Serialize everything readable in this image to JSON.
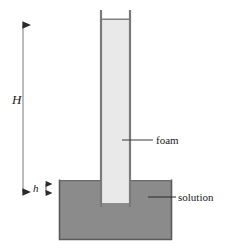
{
  "figure": {
    "type": "schematic-diagram",
    "background_color": "#ffffff"
  },
  "labels": {
    "height_total": "H",
    "height_immersed": "h",
    "foam": "foam",
    "solution": "solution"
  },
  "colors": {
    "foam_fill": "#e9e9e9",
    "solution_fill": "#8b8b8b",
    "outline": "#5a5a5a",
    "tube_wall": "#7a7a7a",
    "text": "#1a1a1a",
    "arrow": "#2b2b2b"
  },
  "geometry": {
    "canvas_width": 230,
    "canvas_height": 248,
    "tube_left_x": 100,
    "tube_right_x": 131,
    "tube_top_y": 10,
    "tube_bottom_y": 207,
    "foam_top_y": 19,
    "foam_bottom_y": 203,
    "vessel_left_x": 59,
    "vessel_right_x": 172,
    "vessel_top_y": 180,
    "vessel_bottom_y": 240,
    "solution_surface_y": 181,
    "dimension_H_x": 23,
    "dimension_H_top_y": 21,
    "dimension_H_bottom_y": 196,
    "dimension_h_x": 46,
    "dimension_h_top_y": 181,
    "dimension_h_bottom_y": 196
  },
  "annotations": {
    "foam_leader_from_x": 122,
    "foam_leader_to_x": 153,
    "foam_leader_y": 140,
    "solution_leader_from_x": 148,
    "solution_leader_to_x": 176,
    "solution_leader_y": 197
  }
}
